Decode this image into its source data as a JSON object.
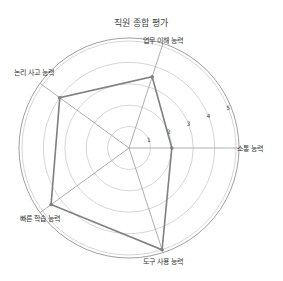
{
  "chart_data": {
    "type": "radar",
    "title": "직원 종합 평가",
    "categories": [
      "소통 능력",
      "업무 이해 능력",
      "논리 사고 능력",
      "빠른 학습 능력",
      "도구 사용 능력"
    ],
    "series": [
      {
        "name": "직원",
        "values": [
          2,
          3.5,
          4,
          4.5,
          5
        ]
      }
    ],
    "rlim": [
      0,
      5
    ],
    "rticks": [
      1,
      2,
      3,
      4,
      5
    ],
    "grid": true,
    "colors": {
      "line": "#808080",
      "grid": "#cccccc",
      "axis": "#999999",
      "frame": "#888888"
    }
  }
}
